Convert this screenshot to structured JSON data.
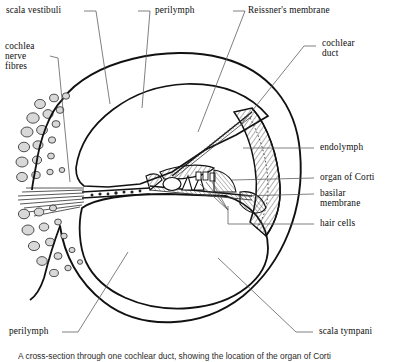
{
  "figure": {
    "caption": "A cross-section through one cochlear duct, showing the location of the organ of Corti",
    "ink_color": "#111111",
    "leader_color": "#555555",
    "background": "#ffffff"
  },
  "labels": {
    "scala_vestibuli": "scala vestibuli",
    "perilymph_top": "perilymph",
    "reissners_membrane": "Reissner's membrane",
    "cochlear_duct_line1": "cochlear",
    "cochlear_duct_line2": "duct",
    "cochlea_nerve_fibres_line1": "cochlea",
    "cochlea_nerve_fibres_line2": "nerve",
    "cochlea_nerve_fibres_line3": "fibres",
    "endolymph": "endolymph",
    "organ_of_corti": "organ of Corti",
    "basilar_membrane_line1": "basilar",
    "basilar_membrane_line2": "membrane",
    "hair_cells": "hair cells",
    "perilymph_bottom": "perilymph",
    "scala_tympani": "scala tympani"
  }
}
